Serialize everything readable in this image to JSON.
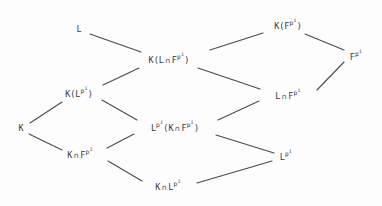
{
  "diagram": {
    "kind": "hasse-lattice-diagram",
    "width": 382,
    "height": 206,
    "background_color": "#fdfdfd",
    "ink_color": "#3a3a3a",
    "edge_color": "#4a4a4a",
    "nodes": [
      {
        "id": "L",
        "plain": "L",
        "parts": [
          {
            "t": "L"
          }
        ],
        "x": 79,
        "y": 29
      },
      {
        "id": "K(F^p^i)",
        "plain": "K(F^p^i)",
        "parts": [
          {
            "t": "K(F"
          },
          {
            "t": "p",
            "sup": 1,
            "sup2": "i"
          },
          {
            "t": ")"
          }
        ],
        "x": 288,
        "y": 25
      },
      {
        "id": "K(L∩F^p^i)",
        "plain": "K(L ∩ F^p^i)",
        "parts": [
          {
            "t": "K(L"
          },
          {
            "t": "∩",
            "cap": true
          },
          {
            "t": "F"
          },
          {
            "t": "p",
            "sup": 1,
            "sup2": "i"
          },
          {
            "t": ")"
          }
        ],
        "x": 169,
        "y": 59
      },
      {
        "id": "F^p^i",
        "plain": "F^p^i",
        "parts": [
          {
            "t": "F"
          },
          {
            "t": "p",
            "sup": 1,
            "sup2": "i"
          }
        ],
        "x": 356,
        "y": 56
      },
      {
        "id": "K(L^p^i)",
        "plain": "K(L^p^i)",
        "parts": [
          {
            "t": "K(L"
          },
          {
            "t": "p",
            "sup": 1,
            "sup2": "i"
          },
          {
            "t": ")"
          }
        ],
        "x": 79,
        "y": 93
      },
      {
        "id": "L∩F^p^i",
        "plain": "L ∩ F^p^i",
        "parts": [
          {
            "t": "L"
          },
          {
            "t": "∩",
            "cap": true
          },
          {
            "t": "F"
          },
          {
            "t": "p",
            "sup": 1,
            "sup2": "i"
          }
        ],
        "x": 288,
        "y": 95
      },
      {
        "id": "K",
        "plain": "K",
        "parts": [
          {
            "t": "K"
          }
        ],
        "x": 21,
        "y": 128
      },
      {
        "id": "L^p^i(K∩F^p^i)",
        "plain": "L^p^i(K ∩ F^p^i)",
        "parts": [
          {
            "t": "L"
          },
          {
            "t": "p",
            "sup": 1,
            "sup2": "i"
          },
          {
            "t": "(K"
          },
          {
            "t": "∩",
            "cap": true
          },
          {
            "t": "F"
          },
          {
            "t": "p",
            "sup": 1,
            "sup2": "i"
          },
          {
            "t": ")"
          }
        ],
        "x": 175,
        "y": 127
      },
      {
        "id": "K∩F^p^i",
        "plain": "K ∩ F^p^i",
        "parts": [
          {
            "t": "K"
          },
          {
            "t": "∩",
            "cap": true
          },
          {
            "t": "F"
          },
          {
            "t": "p",
            "sup": 1,
            "sup2": "i"
          }
        ],
        "x": 80,
        "y": 154
      },
      {
        "id": "L^p^i",
        "plain": "L^p^i",
        "parts": [
          {
            "t": "L"
          },
          {
            "t": "p",
            "sup": 1,
            "sup2": "i"
          }
        ],
        "x": 286,
        "y": 156
      },
      {
        "id": "K∩L^p^i",
        "plain": "K ∩ L^p^i",
        "parts": [
          {
            "t": "K"
          },
          {
            "t": "∩",
            "cap": true
          },
          {
            "t": "L"
          },
          {
            "t": "p",
            "sup": 1,
            "sup2": "i"
          }
        ],
        "x": 168,
        "y": 186
      }
    ],
    "edges": [
      {
        "from": "L",
        "to": "K(L∩F^p^i)",
        "x1": 90,
        "y1": 34,
        "x2": 141,
        "y2": 52
      },
      {
        "from": "K(L∩F^p^i)",
        "to": "K(F^p^i)",
        "x1": 210,
        "y1": 50,
        "x2": 263,
        "y2": 33
      },
      {
        "from": "K(F^p^i)",
        "to": "F^p^i",
        "x1": 305,
        "y1": 34,
        "x2": 344,
        "y2": 50
      },
      {
        "from": "K(L∩F^p^i)",
        "to": "L∩F^p^i",
        "x1": 198,
        "y1": 68,
        "x2": 260,
        "y2": 89
      },
      {
        "from": "L∩F^p^i",
        "to": "F^p^i",
        "x1": 317,
        "y1": 90,
        "x2": 344,
        "y2": 62
      },
      {
        "from": "K(L^p^i)",
        "to": "K(L∩F^p^i)",
        "x1": 103,
        "y1": 85,
        "x2": 139,
        "y2": 68
      },
      {
        "from": "K",
        "to": "K(L^p^i)",
        "x1": 30,
        "y1": 123,
        "x2": 62,
        "y2": 102
      },
      {
        "from": "K(L^p^i)",
        "to": "L^p^i(K∩F^p^i)",
        "x1": 102,
        "y1": 100,
        "x2": 137,
        "y2": 120
      },
      {
        "from": "K",
        "to": "K∩F^p^i",
        "x1": 29,
        "y1": 134,
        "x2": 62,
        "y2": 150
      },
      {
        "from": "K∩F^p^i",
        "to": "L^p^i(K∩F^p^i)",
        "x1": 107,
        "y1": 148,
        "x2": 134,
        "y2": 134
      },
      {
        "from": "L^p^i(K∩F^p^i)",
        "to": "L∩F^p^i",
        "x1": 218,
        "y1": 120,
        "x2": 259,
        "y2": 101
      },
      {
        "from": "L^p^i(K∩F^p^i)",
        "to": "L^p^i",
        "x1": 216,
        "y1": 135,
        "x2": 274,
        "y2": 153
      },
      {
        "from": "K∩F^p^i",
        "to": "K∩L^p^i",
        "x1": 108,
        "y1": 161,
        "x2": 142,
        "y2": 181
      },
      {
        "from": "K∩L^p^i",
        "to": "L^p^i",
        "x1": 197,
        "y1": 183,
        "x2": 272,
        "y2": 161
      }
    ]
  }
}
